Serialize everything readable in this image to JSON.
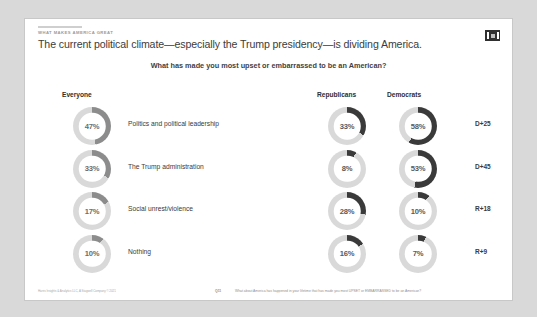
{
  "slide": {
    "eyebrow": "WHAT MAKES AMERICA GREAT",
    "headline": "The current political climate—especially the Trump presidency—is dividing America.",
    "subquestion": "What has made you most upset or embarrassed to be an American?",
    "logo_name": "harris-poll-logo"
  },
  "columns": {
    "everyone": "Everyone",
    "republicans": "Republicans",
    "democrats": "Democrats"
  },
  "footer": {
    "credit": "Harris Insights & Analytics LLC, A Stagwell Company © 2021",
    "question_number": "Q11",
    "question_text": "What about America has happened in your lifetime that has made you most UPSET or EMBARRASSED to be an American?"
  },
  "colors": {
    "track": "#d9d9d9",
    "arc_everyone": "#8c8c8c",
    "arc_party": "#3a3a3a",
    "card_background": "#ffffff",
    "page_background": "#d9d9d9"
  },
  "chart_data": {
    "type": "pie",
    "title": "What has made you most upset or embarrassed to be an American?",
    "subtitle": "The current political climate—especially the Trump presidency—is dividing America.",
    "categories": [
      "Politics and political leadership",
      "The Trump administration",
      "Social unrest/violence",
      "Nothing"
    ],
    "series": [
      {
        "name": "Everyone",
        "values": [
          47,
          33,
          17,
          10
        ]
      },
      {
        "name": "Republicans",
        "values": [
          33,
          8,
          28,
          16
        ]
      },
      {
        "name": "Democrats",
        "values": [
          58,
          53,
          10,
          7
        ]
      }
    ],
    "diff_labels": [
      "D+25",
      "D+45",
      "R+18",
      "R+9"
    ],
    "value_suffix": "%",
    "legend_position": "top"
  },
  "rows": [
    {
      "label": "Politics and political leadership",
      "everyone": "47%",
      "everyone_pct": 47,
      "republicans": "33%",
      "republicans_pct": 33,
      "democrats": "58%",
      "democrats_pct": 58,
      "diff": "D+25"
    },
    {
      "label": "The Trump administration",
      "everyone": "33%",
      "everyone_pct": 33,
      "republicans": "8%",
      "republicans_pct": 8,
      "democrats": "53%",
      "democrats_pct": 53,
      "diff": "D+45"
    },
    {
      "label": "Social unrest/violence",
      "everyone": "17%",
      "everyone_pct": 17,
      "republicans": "28%",
      "republicans_pct": 28,
      "democrats": "10%",
      "democrats_pct": 10,
      "diff": "R+18"
    },
    {
      "label": "Nothing",
      "everyone": "10%",
      "everyone_pct": 10,
      "republicans": "16%",
      "republicans_pct": 16,
      "democrats": "7%",
      "democrats_pct": 7,
      "diff": "R+9"
    }
  ]
}
